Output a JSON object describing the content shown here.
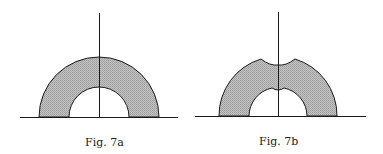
{
  "figures": [
    {
      "id": "7a",
      "caption": "Fig. 7a",
      "description": "Shaded semicircular annulus on a baseline, with vertical axis of symmetry"
    },
    {
      "id": "7b",
      "caption": "Fig. 7b",
      "description": "Shaded semicircular annulus with a notch dipping at the top on both outer and inner edges, on a baseline, with vertical axis"
    }
  ],
  "colors": {
    "stroke": "#1a1a1a",
    "fill": "#b8b8b8",
    "background": "#ffffff"
  }
}
